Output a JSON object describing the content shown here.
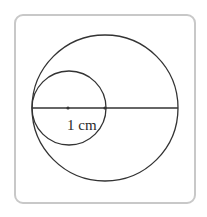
{
  "diagram": {
    "type": "geometry-circles",
    "frame": {
      "border_color": "#c8c8c8",
      "background": "#ffffff"
    },
    "stroke_color": "#333333",
    "large_circle": {
      "cx": 105,
      "cy": 108,
      "r": 73
    },
    "small_circle": {
      "cx": 69,
      "cy": 108,
      "r": 37
    },
    "diameter_line": {
      "x1": 32,
      "y1": 108,
      "x2": 178,
      "y2": 108
    },
    "points": [
      {
        "name": "small-circle-center",
        "x": 68,
        "y": 108
      },
      {
        "name": "large-circle-center",
        "x": 105,
        "y": 108
      }
    ],
    "label": {
      "text": "1 cm",
      "x": 67,
      "y": 130
    }
  }
}
